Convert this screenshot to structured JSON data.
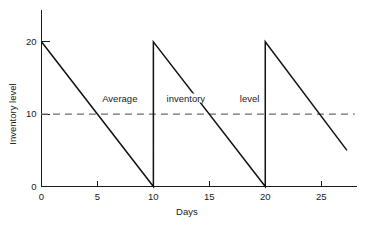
{
  "chart_data": {
    "type": "line",
    "title": "",
    "xlabel": "Days",
    "ylabel": "Inventory level",
    "xlim": [
      0,
      28.2
    ],
    "ylim": [
      0,
      24.4
    ],
    "grid": false,
    "legend": "none",
    "xticks": [
      0,
      5,
      10,
      15,
      20,
      25
    ],
    "xtick_labels": [
      "0",
      "5",
      "10",
      "15",
      "20",
      "25"
    ],
    "yticks": [
      0,
      10,
      20
    ],
    "ytick_labels": [
      "0",
      "10",
      "20"
    ],
    "series": [
      {
        "name": "Inventory level",
        "style": "solid",
        "color": "#111111",
        "points": [
          [
            0,
            20
          ],
          [
            10,
            0
          ],
          [
            10,
            20
          ],
          [
            20,
            0
          ],
          [
            20,
            20
          ],
          [
            27.3,
            5
          ]
        ]
      },
      {
        "name": "Average inventory level",
        "style": "dashed",
        "color": "#6d6d6d",
        "value": 10,
        "points": [
          [
            -0.05,
            10
          ],
          [
            28.0,
            10
          ]
        ]
      }
    ],
    "annotations": [
      {
        "text": "Average",
        "x": 7.0,
        "y": 11.6
      },
      {
        "text": "inventory",
        "x": 12.9,
        "y": 11.6
      },
      {
        "text": "level",
        "x": 18.6,
        "y": 11.6
      }
    ]
  },
  "axis_titles": {
    "x": "Days",
    "y": "Inventory level"
  }
}
